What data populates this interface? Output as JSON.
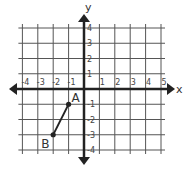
{
  "chart_data": {
    "type": "scatter",
    "title": "",
    "xlabel": "x",
    "ylabel": "y",
    "xlim": [
      -4,
      5
    ],
    "ylim": [
      -4,
      4
    ],
    "grid": true,
    "x_ticks": [
      "-4",
      "-3",
      "-2",
      "-1",
      "1",
      "2",
      "3",
      "4",
      "5"
    ],
    "y_ticks": [
      "4",
      "3",
      "2",
      "1",
      "-1",
      "-2",
      "-3",
      "-4"
    ],
    "points": [
      {
        "label": "A",
        "x": -1,
        "y": -1
      },
      {
        "label": "B",
        "x": -2,
        "y": -3
      }
    ],
    "segments": [
      {
        "from": "A",
        "to": "B"
      }
    ],
    "colors": {
      "grid": "#555555",
      "axis": "#222222",
      "segment": "#222222"
    }
  }
}
